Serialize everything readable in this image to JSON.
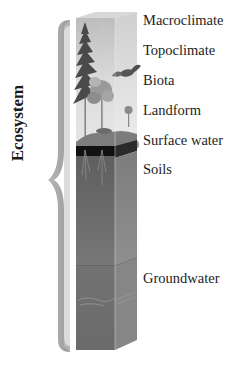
{
  "title": "Ecosystem",
  "bracket_label": "Ecosystem",
  "layers": [
    {
      "label": "Macroclimate",
      "y": 12
    },
    {
      "label": "Topoclimate",
      "y": 42
    },
    {
      "label": "Biota",
      "y": 72
    },
    {
      "label": "Landform",
      "y": 102
    },
    {
      "label": "Surface water",
      "y": 132
    },
    {
      "label": "Soils",
      "y": 161
    },
    {
      "label": "Groundwater",
      "y": 270
    }
  ],
  "colors": {
    "sky_top": "#c8c8c8",
    "sky_bottom": "#e8e8e8",
    "soil_dark": "#111111",
    "subsoil": "#6e6e6e",
    "groundwater": "#7a7a7a",
    "bracket": "#a8a8a8",
    "text": "#1e1e1e"
  }
}
